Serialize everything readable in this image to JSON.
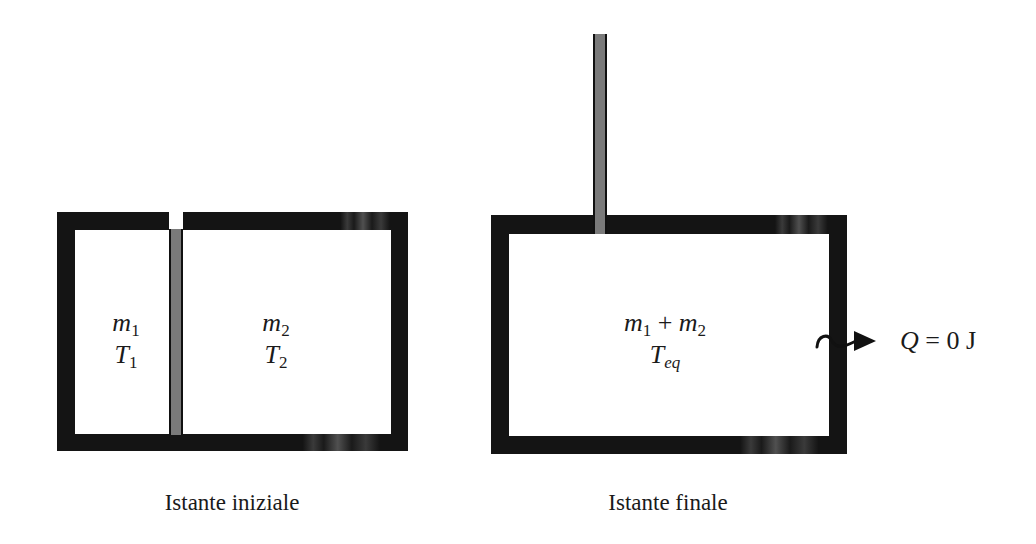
{
  "diagram": {
    "title": "",
    "initial_state": {
      "caption": "Istante iniziale",
      "left_chamber": {
        "mass": "m",
        "mass_sub": "1",
        "temp": "T",
        "temp_sub": "1"
      },
      "right_chamber": {
        "mass": "m",
        "mass_sub": "2",
        "temp": "T",
        "temp_sub": "2"
      },
      "elements": [
        "insulated container",
        "removable partition (grey)",
        "gap in top wall for partition"
      ]
    },
    "final_state": {
      "caption": "Istante finale",
      "chamber": {
        "mass_a": "m",
        "mass_a_sub": "1",
        "plus": "+",
        "mass_b": "m",
        "mass_b_sub": "2",
        "temp": "T",
        "temp_sub": "eq"
      },
      "elements": [
        "insulated container",
        "partition withdrawn upward (grey rod)",
        "wavy heat arrow crossing right wall"
      ],
      "heat": {
        "symbol": "Q",
        "equals": "=",
        "value": "0",
        "unit": "J"
      }
    },
    "colors": {
      "wall": "#141414",
      "partition": "#7a7a7a",
      "background": "#ffffff",
      "text": "#1a1a1a"
    }
  }
}
